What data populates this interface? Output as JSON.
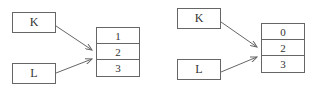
{
  "diagrams": [
    {
      "pointers": [
        {
          "label": "K"
        },
        {
          "label": "L"
        }
      ],
      "cells": [
        "1",
        "2",
        "3"
      ]
    },
    {
      "pointers": [
        {
          "label": "K"
        },
        {
          "label": "L"
        }
      ],
      "cells": [
        "0",
        "2",
        "3"
      ]
    }
  ],
  "colors": {
    "line": "#666666",
    "text": "#333333"
  }
}
